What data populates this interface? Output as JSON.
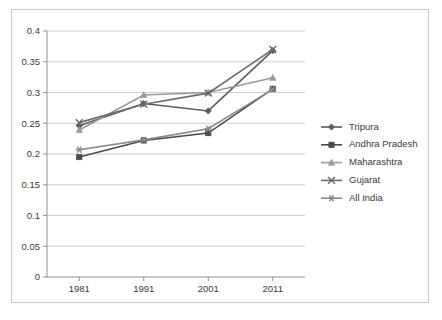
{
  "chart_data": {
    "type": "line",
    "title": "",
    "subtitle": "",
    "xlabel": "",
    "ylabel": "",
    "categories": [
      "1981",
      "1991",
      "2001",
      "2011"
    ],
    "x_tick_labels": [
      "1981",
      "1991",
      "2001",
      "2011"
    ],
    "y_tick_labels": [
      "0",
      "0.05",
      "0.1",
      "0.15",
      "0.2",
      "0.25",
      "0.3",
      "0.35",
      "0.4"
    ],
    "y_tick_values": [
      0,
      0.05,
      0.1,
      0.15,
      0.2,
      0.25,
      0.3,
      0.35,
      0.4
    ],
    "ylim": [
      0,
      0.4
    ],
    "grid": "horizontal",
    "legend_position": "right",
    "series": [
      {
        "name": "Tripura",
        "marker": "diamond",
        "color": "#5d5d5d",
        "values": [
          0.246,
          0.282,
          0.27,
          0.368
        ]
      },
      {
        "name": "Andhra Pradesh",
        "marker": "square",
        "color": "#4a4a4a",
        "values": [
          0.195,
          0.222,
          0.234,
          0.306
        ]
      },
      {
        "name": "Maharashtra",
        "marker": "triangle",
        "color": "#9a9a9a",
        "values": [
          0.239,
          0.296,
          0.3,
          0.324
        ]
      },
      {
        "name": "Gujarat",
        "marker": "cross",
        "color": "#6b6b6b",
        "values": [
          0.251,
          0.281,
          0.299,
          0.37
        ]
      },
      {
        "name": "All India",
        "marker": "star",
        "color": "#8a8a8a",
        "values": [
          0.207,
          0.223,
          0.241,
          0.305
        ]
      }
    ]
  },
  "legend": {
    "items": [
      {
        "label": "Tripura"
      },
      {
        "label": "Andhra Pradesh"
      },
      {
        "label": "Maharashtra"
      },
      {
        "label": "Gujarat"
      },
      {
        "label": "All India"
      }
    ]
  },
  "axes": {
    "y_labels": [
      "0.4",
      "0.35",
      "0.3",
      "0.25",
      "0.2",
      "0.15",
      "0.1",
      "0.05",
      "0"
    ],
    "x_labels": [
      "1981",
      "1991",
      "2001",
      "2011"
    ]
  }
}
